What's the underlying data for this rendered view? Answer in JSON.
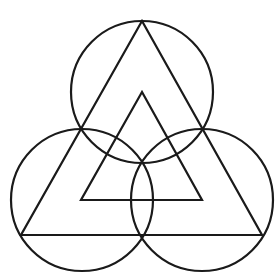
{
  "diagram": {
    "stroke_color": "#1a1a1a",
    "background_color": "#ffffff",
    "stroke_width": 2.2,
    "circles": [
      {
        "name": "top-circle",
        "cx": 142,
        "cy": 92,
        "r": 71
      },
      {
        "name": "bottom-left-circle",
        "cx": 82,
        "cy": 200,
        "r": 71
      },
      {
        "name": "bottom-right-circle",
        "cx": 202,
        "cy": 200,
        "r": 71
      }
    ],
    "outer_triangle": {
      "points": "142,21 21,235 262,235"
    },
    "inner_triangle": {
      "points": "142,92 81,200 202,200"
    }
  }
}
